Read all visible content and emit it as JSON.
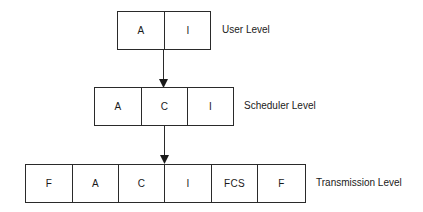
{
  "diagram": {
    "type": "protocol-frame-levels",
    "levels": [
      {
        "name": "user",
        "label": "User Level",
        "fields": [
          "A",
          "I"
        ]
      },
      {
        "name": "scheduler",
        "label": "Scheduler Level",
        "fields": [
          "A",
          "C",
          "I"
        ]
      },
      {
        "name": "transmission",
        "label": "Transmission Level",
        "fields": [
          "F",
          "A",
          "C",
          "I",
          "FCS",
          "F"
        ]
      }
    ],
    "arrows": [
      {
        "from": "user",
        "to": "scheduler"
      },
      {
        "from": "scheduler",
        "to": "transmission"
      }
    ],
    "colors": {
      "line": "#2a2a2a",
      "text": "#1a1a1a",
      "background": "#ffffff"
    }
  }
}
